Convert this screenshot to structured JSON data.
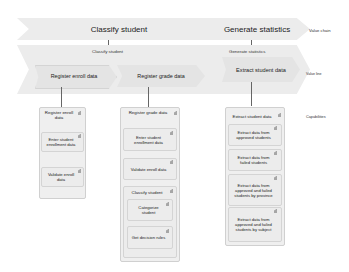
{
  "value_chain": {
    "row_label": "Value chain",
    "items": [
      {
        "label": "Classify student"
      },
      {
        "label": "Generate statistics"
      }
    ]
  },
  "value_line": {
    "row_label": "Value line",
    "groups": [
      {
        "label": "Classify student",
        "items": [
          {
            "label": "Register enroll data"
          },
          {
            "label": "Register grade data"
          }
        ]
      },
      {
        "label": "Generate statistics",
        "items": [
          {
            "label": "Extract student data"
          }
        ]
      }
    ]
  },
  "capabilities": {
    "row_label": "Capabilities",
    "columns": [
      {
        "title": "Register enroll data",
        "items": [
          {
            "label": "Enter student enrollment data"
          },
          {
            "label": "Validate enroll data"
          }
        ]
      },
      {
        "title": "Register grade data",
        "items": [
          {
            "label": "Enter student enrollment data"
          },
          {
            "label": "Validate enroll data"
          }
        ],
        "subgroup": {
          "title": "Classify student",
          "items": [
            {
              "label": "Categorize student"
            },
            {
              "label": "Get decision rules"
            }
          ]
        }
      },
      {
        "title": "Extract student data",
        "items": [
          {
            "label": "Extract data from approved students"
          },
          {
            "label": "Extract data from failed students"
          },
          {
            "label": "Extract data from approved and failed students by province"
          },
          {
            "label": "Extract data from approved and failed students by subject"
          }
        ]
      }
    ]
  },
  "colors": {
    "chevron_fill": "#ececec",
    "inner_chevron_fill": "#e4e4e4",
    "box_border": "#d0d0d0",
    "connector": "#666666"
  }
}
